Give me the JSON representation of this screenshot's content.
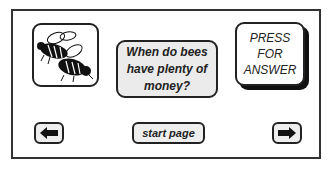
{
  "card": {
    "image": {
      "icon": "bees-icon",
      "alt": "two bees"
    },
    "question": "When do bees have plenty of money?",
    "press_button": "PRESS FOR ANSWER"
  },
  "nav": {
    "back_icon": "arrow-left-icon",
    "start_label": "start page",
    "forward_icon": "arrow-right-icon"
  },
  "colors": {
    "border": "#222222",
    "card_fill": "#ebebeb",
    "background": "#ffffff"
  }
}
